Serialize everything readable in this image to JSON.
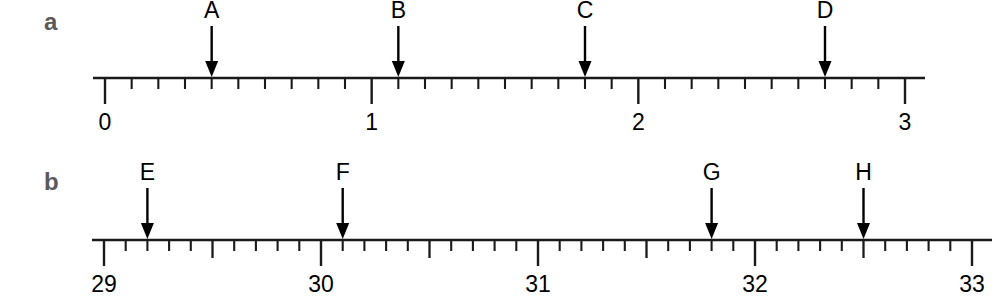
{
  "figure": {
    "type": "number-line-diagram",
    "width": 998,
    "height": 304,
    "background": "#ffffff",
    "ink_color": "#1a1a1a",
    "panel_label_color": "#5a5a5a"
  },
  "chart_data": {
    "type": "line",
    "title": "",
    "panels": [
      {
        "id": "a",
        "label": "a",
        "xlim": [
          0,
          3
        ],
        "tick_labels": [
          "0",
          "1",
          "2",
          "3"
        ],
        "major_ticks": [
          0,
          1,
          2,
          3
        ],
        "minor_tick_step": 0.1,
        "medium_tick_step": null,
        "grid": false,
        "pixel": {
          "x0": 105,
          "x3": 905,
          "unit_px": 266.67,
          "axis_y": 78
        },
        "markers": [
          {
            "name": "A",
            "value": 0.4,
            "px": 211.7
          },
          {
            "name": "B",
            "value": 1.1,
            "px": 398.3
          },
          {
            "name": "C",
            "value": 1.8,
            "px": 585.0
          },
          {
            "name": "D",
            "value": 2.7,
            "px": 825.0
          }
        ]
      },
      {
        "id": "b",
        "label": "b",
        "xlim": [
          29,
          33
        ],
        "tick_labels": [
          "29",
          "30",
          "31",
          "32",
          "33"
        ],
        "major_ticks": [
          29,
          30,
          31,
          32,
          33
        ],
        "minor_tick_step": 0.1,
        "medium_tick_step": 0.5,
        "grid": false,
        "pixel": {
          "x0": 104,
          "x4": 972,
          "unit_px": 217.0,
          "axis_y": 88
        },
        "markers": [
          {
            "name": "E",
            "value": 29.2,
            "px": 147.4
          },
          {
            "name": "F",
            "value": 30.1,
            "px": 342.7
          },
          {
            "name": "G",
            "value": 31.8,
            "px": 711.6
          },
          {
            "name": "H",
            "value": 32.5,
            "px": 863.5
          }
        ]
      }
    ]
  }
}
